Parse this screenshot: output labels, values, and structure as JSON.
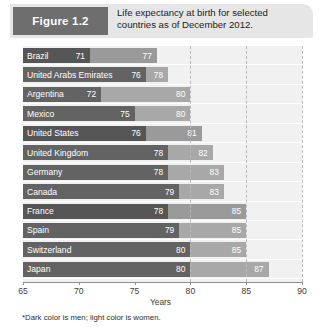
{
  "figure": {
    "badge_label": "Figure 1.2",
    "caption": "Life expectancy at birth for selected countries as of December 2012."
  },
  "footnote": "*Dark color is men; light color is women.",
  "colors": {
    "men_dark": "#636363",
    "men_darker": "#565656",
    "women_light": "#9a9a9a",
    "women_lighter": "#a8a8a8",
    "plot_background": "#f1f1f1",
    "header_background": "#e6e6e6",
    "badge_background": "#6e6e6e",
    "gridline": "#b9b9b9",
    "axis": "#8d8d8d"
  },
  "chart_data": {
    "type": "bar",
    "orientation": "horizontal",
    "title": "Life expectancy at birth for selected countries as of December 2012.",
    "xlabel": "Years",
    "ylabel": "",
    "xlim": [
      65,
      90
    ],
    "xticks": [
      65,
      70,
      75,
      80,
      85,
      90
    ],
    "xtick_labels": [
      "65",
      "70",
      "75",
      "80",
      "85",
      "90"
    ],
    "grid": "vertical dashed at 80, 85, 90",
    "legend": "Dark color is men; light color is women.",
    "legend_position": "footnote",
    "categories": [
      "Brazil",
      "United Arabs Emirates",
      "Argentina",
      "Mexico",
      "United States",
      "United Kingdom",
      "Germany",
      "Canada",
      "France",
      "Spain",
      "Switzerland",
      "Japan"
    ],
    "series": [
      {
        "name": "Men",
        "values": [
          71,
          76,
          72,
          75,
          76,
          78,
          78,
          79,
          78,
          79,
          80,
          80
        ]
      },
      {
        "name": "Women",
        "values": [
          77,
          78,
          80,
          80,
          81,
          82,
          83,
          83,
          85,
          85,
          85,
          87
        ]
      }
    ],
    "rows": [
      {
        "country": "Brazil",
        "men": 71,
        "women": 77,
        "shade": "dark"
      },
      {
        "country": "United Arabs Emirates",
        "men": 76,
        "women": 78,
        "shade": "light"
      },
      {
        "country": "Argentina",
        "men": 72,
        "women": 80,
        "shade": "light"
      },
      {
        "country": "Mexico",
        "men": 75,
        "women": 80,
        "shade": "light"
      },
      {
        "country": "United States",
        "men": 76,
        "women": 81,
        "shade": "dark"
      },
      {
        "country": "United Kingdom",
        "men": 78,
        "women": 82,
        "shade": "light"
      },
      {
        "country": "Germany",
        "men": 78,
        "women": 83,
        "shade": "light"
      },
      {
        "country": "Canada",
        "men": 79,
        "women": 83,
        "shade": "light"
      },
      {
        "country": "France",
        "men": 78,
        "women": 85,
        "shade": "dark"
      },
      {
        "country": "Spain",
        "men": 79,
        "women": 85,
        "shade": "light"
      },
      {
        "country": "Switzerland",
        "men": 80,
        "women": 85,
        "shade": "light"
      },
      {
        "country": "Japan",
        "men": 80,
        "women": 87,
        "shade": "light"
      }
    ]
  }
}
